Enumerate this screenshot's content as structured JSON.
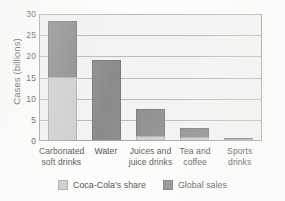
{
  "chart_data": {
    "type": "bar",
    "title": "",
    "subtitle": "",
    "xlabel": "",
    "ylabel": "Cases (billions)",
    "ylim": [
      0,
      30
    ],
    "yticks": [
      0,
      5,
      10,
      15,
      20,
      25,
      30
    ],
    "ytick_labels": [
      "0",
      "5",
      "10",
      "15",
      "20",
      "25",
      "30"
    ],
    "grid": "horizontal",
    "stacked": true,
    "legend_position": "bottom-center",
    "categories": [
      "Carbonated soft drinks",
      "Water",
      "Juices and juice drinks",
      "Tea and coffee",
      "Sports drinks"
    ],
    "category_lines": [
      [
        "Carbonated",
        "soft drinks"
      ],
      [
        "Water"
      ],
      [
        "Juices and",
        "juice drinks"
      ],
      [
        "Tea and",
        "coffee"
      ],
      [
        "Sports",
        "drinks"
      ]
    ],
    "series": [
      {
        "name": "Coca-Cola's share",
        "color": "#c3c3c1",
        "values": [
          14.8,
          0.0,
          0.9,
          0.8,
          0.15
        ]
      },
      {
        "name": "Global sales",
        "color": "#6e6e6e",
        "values": [
          13.4,
          19.0,
          6.5,
          2.0,
          0.35
        ]
      }
    ],
    "totals": [
      28.2,
      19.0,
      7.4,
      2.8,
      0.5
    ],
    "annotations": []
  },
  "legend": {
    "items": [
      {
        "label": "Coca-Cola's share",
        "swatch": "light-gray"
      },
      {
        "label": "Global sales",
        "swatch": "dark-gray"
      }
    ]
  },
  "colors": {
    "share": "#c3c3c1",
    "global": "#6e6e6e",
    "plot_background": "#f2f1ef",
    "gridline": "#a9a9a6",
    "axis": "#8d8d8b",
    "text": "#1b1b1b"
  }
}
